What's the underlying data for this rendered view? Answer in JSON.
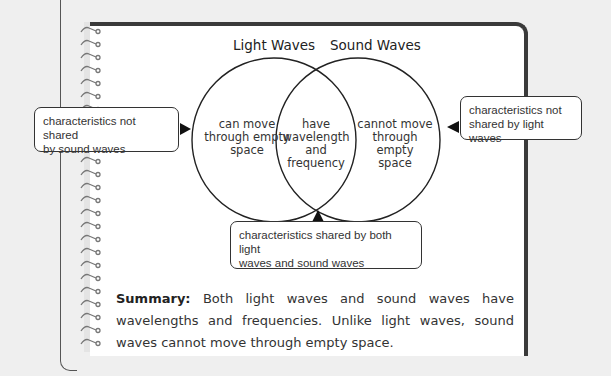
{
  "diagram": {
    "type": "venn",
    "sets": [
      {
        "label": "Light Waves",
        "unique": "can move through empty space"
      },
      {
        "label": "Sound Waves",
        "unique": "cannot move through empty space"
      }
    ],
    "intersection": "have wavelength and frequency"
  },
  "titles": {
    "left": "Light Waves",
    "right": "Sound Waves"
  },
  "regions": {
    "left": [
      "can move",
      "through empty",
      "space"
    ],
    "center": [
      "have",
      "wavelength",
      "and",
      "frequency"
    ],
    "right": [
      "cannot move",
      "through empty",
      "space"
    ]
  },
  "callouts": {
    "left": [
      "characteristics not shared",
      "by sound waves"
    ],
    "right": [
      "characteristics not",
      "shared by light waves"
    ],
    "bottom": [
      "characteristics shared by both light",
      "waves and sound waves"
    ]
  },
  "summary": {
    "label": "Summary:",
    "text": " Both light waves and sound waves have wavelengths and frequencies. Unlike light waves, sound waves cannot move through empty space."
  },
  "colors": {
    "page": "#ffffff",
    "background": "#efefef",
    "border": "#3a3a3a",
    "line": "#222222"
  }
}
